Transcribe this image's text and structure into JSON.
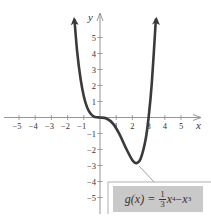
{
  "chart_data": {
    "type": "line",
    "title": "",
    "xlabel": "x",
    "ylabel": "y",
    "xlim": [
      -5.5,
      6
    ],
    "ylim": [
      -6,
      6.5
    ],
    "grid": false,
    "x_ticks": [
      -5,
      -4,
      -3,
      -2,
      -1,
      1,
      2,
      3,
      4,
      5
    ],
    "y_ticks": [
      -5,
      -4,
      -3,
      -2,
      -1,
      1,
      2,
      3,
      4,
      5
    ],
    "x_tick_labels": [
      "−5",
      "−4",
      "−3",
      "−2",
      "−1",
      "1",
      "2",
      "3",
      "4",
      "5"
    ],
    "y_tick_labels": [
      "−5",
      "−4",
      "−3",
      "−2",
      "−1",
      "1",
      "2",
      "3",
      "4",
      "5"
    ],
    "series": [
      {
        "name": "g(x) = (1/3)x^4 − x^3",
        "color": "#3a3a3a",
        "arrows_at_ends": true,
        "x": [
          -1.58,
          -1.4,
          -1.2,
          -1.0,
          -0.8,
          -0.6,
          -0.4,
          -0.2,
          0,
          0.4,
          0.8,
          1.2,
          1.6,
          2.0,
          2.25,
          2.5,
          2.8,
          3.0,
          3.2,
          3.45
        ],
        "y": [
          6.15,
          4.02,
          2.42,
          1.33,
          0.65,
          0.26,
          0.07,
          0.01,
          0,
          -0.06,
          -0.38,
          -1.04,
          -1.91,
          -2.67,
          -2.85,
          -2.6,
          -1.46,
          0,
          2.18,
          6.17
        ]
      }
    ],
    "annotations": [
      {
        "text": "g(x) = (1/3)x⁴ − x³",
        "points_to": [
          2.25,
          -2.85
        ]
      }
    ]
  },
  "formula": {
    "lhs": "g(x) =",
    "frac_num": "1",
    "frac_den": "3",
    "term1": "x",
    "exp1": "4",
    "minus": " − ",
    "term2": "x",
    "exp2": "3"
  },
  "axes": {
    "x_name": "x",
    "y_name": "y"
  }
}
